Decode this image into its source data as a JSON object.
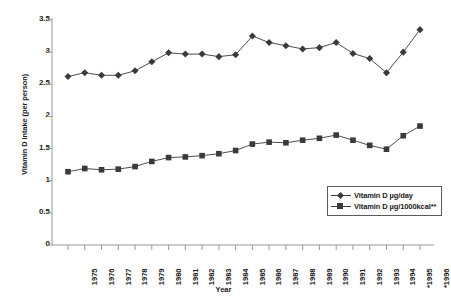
{
  "chart_data": {
    "type": "line",
    "title": "",
    "xlabel": "Year",
    "ylabel": "Vitamin D intake (per person)",
    "categories": [
      "1975",
      "1976",
      "1977",
      "1978",
      "1979",
      "1980",
      "1981",
      "1982",
      "1983",
      "1984",
      "1985",
      "1986",
      "1987",
      "1988",
      "1989",
      "1990",
      "1991",
      "1992",
      "1993",
      "1994",
      "*1995",
      "*1996"
    ],
    "series": [
      {
        "name": "Vitamin D µg/day",
        "marker": "diamond",
        "color": "#3a3a3a",
        "values": [
          2.62,
          2.68,
          2.64,
          2.64,
          2.71,
          2.85,
          2.99,
          2.97,
          2.97,
          2.93,
          2.96,
          3.25,
          3.15,
          3.1,
          3.05,
          3.07,
          3.15,
          2.98,
          2.9,
          2.68,
          3.0,
          3.35
        ]
      },
      {
        "name": "Vitamin D µg/1000kcal**",
        "marker": "square",
        "color": "#3a3a3a",
        "values": [
          1.14,
          1.19,
          1.17,
          1.18,
          1.22,
          1.3,
          1.36,
          1.37,
          1.39,
          1.42,
          1.47,
          1.57,
          1.6,
          1.59,
          1.63,
          1.66,
          1.71,
          1.63,
          1.55,
          1.49,
          1.7,
          1.85
        ]
      }
    ],
    "ylim": [
      0,
      3.5
    ],
    "yticks": [
      0,
      0.5,
      1,
      1.5,
      2,
      2.5,
      3,
      3.5
    ],
    "ytick_labels": [
      "0",
      "0.5",
      "1",
      "1.5",
      "2",
      "2.5",
      "3",
      "3.5"
    ],
    "grid": false,
    "legend_position": "center-right",
    "axis_color": "#9a9a9a"
  }
}
